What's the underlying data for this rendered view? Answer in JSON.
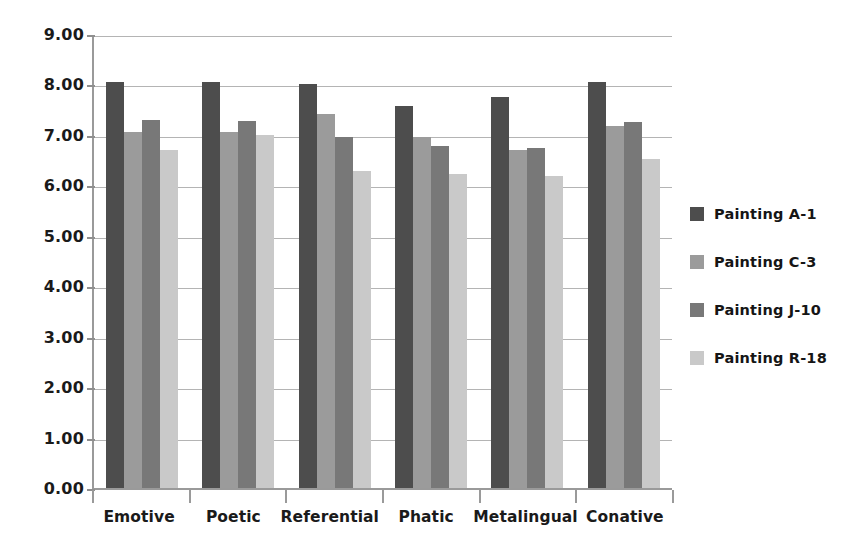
{
  "chart_data": {
    "type": "bar",
    "title": "",
    "subtitle": "",
    "xlabel": "",
    "ylabel": "",
    "ylim": [
      0,
      9
    ],
    "ytick_step": 1,
    "ytick_labels": [
      "9.00",
      "8.00",
      "7.00",
      "6.00",
      "5.00",
      "4.00",
      "3.00",
      "2.00",
      "1.00",
      "0.00"
    ],
    "grid": "horizontal",
    "legend_position": "right",
    "categories": [
      "Emotive",
      "Poetic",
      "Referential",
      "Phatic",
      "Metalingual",
      "Conative"
    ],
    "series": [
      {
        "name": "Painting A-1",
        "color": "#4d4d4d",
        "values": [
          8.05,
          8.05,
          8.0,
          7.58,
          7.75,
          8.05
        ]
      },
      {
        "name": "Painting C-3",
        "color": "#9b9b9b",
        "values": [
          7.05,
          7.05,
          7.42,
          6.95,
          6.7,
          7.18
        ]
      },
      {
        "name": "Painting J-10",
        "color": "#787878",
        "values": [
          7.3,
          7.28,
          6.95,
          6.78,
          6.75,
          7.25
        ]
      },
      {
        "name": "Painting R-18",
        "color": "#c9c9c9",
        "values": [
          6.7,
          7.0,
          6.28,
          6.22,
          6.18,
          6.52
        ]
      }
    ]
  },
  "axis": {
    "line_color": "#9a9a9a",
    "grid_color": "#b4b4b4"
  },
  "legend": {
    "items": [
      {
        "label": "Painting A-1",
        "color": "#4d4d4d"
      },
      {
        "label": "Painting C-3",
        "color": "#9b9b9b"
      },
      {
        "label": "Painting J-10",
        "color": "#787878"
      },
      {
        "label": "Painting R-18",
        "color": "#c9c9c9"
      }
    ]
  }
}
